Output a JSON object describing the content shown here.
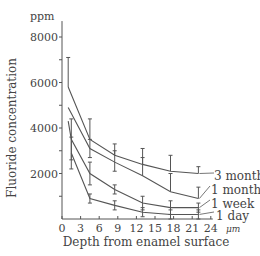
{
  "chart_data": {
    "type": "line",
    "title": "",
    "xlabel": "Depth from enamel surface",
    "x_unit": "μm",
    "ylabel": "Fluoride concentration",
    "y_unit": "ppm",
    "xlim": [
      0,
      24
    ],
    "ylim": [
      0,
      8000
    ],
    "x_ticks": [
      0,
      3,
      6,
      9,
      12,
      15,
      18,
      21,
      24
    ],
    "y_ticks_labeled": [
      2000,
      4000,
      6000,
      8000
    ],
    "y_ticks_minor": [
      1000,
      3000,
      5000,
      7000
    ],
    "grid": false,
    "legend_position": "inline-right",
    "series": [
      {
        "name": "3 months",
        "x": [
          1,
          4.5,
          8.5,
          13,
          17.5,
          22
        ],
        "values": [
          5800,
          3500,
          2800,
          2400,
          2100,
          2000
        ],
        "err_up": [
          1300,
          900,
          500,
          700,
          700,
          300
        ]
      },
      {
        "name": "1 month",
        "x": [
          1,
          4.5,
          8.5,
          13,
          17.5,
          22
        ],
        "values": [
          4900,
          3100,
          2500,
          1900,
          1200,
          900
        ],
        "err_up": [
          0,
          400,
          500,
          800,
          800,
          500
        ],
        "err_down": [
          0,
          400,
          400,
          0,
          0,
          0
        ]
      },
      {
        "name": "1 week",
        "x": [
          1,
          1.5,
          4.5,
          8.5,
          13,
          17.5,
          22
        ],
        "values": [
          4300,
          3500,
          2000,
          1300,
          700,
          500,
          500
        ],
        "err_up": [
          0,
          900,
          500,
          200,
          300,
          300,
          200
        ],
        "err_down": [
          0,
          900,
          500,
          200,
          300,
          300,
          200
        ]
      },
      {
        "name": "1 day",
        "x": [
          1.5,
          4.5,
          8.5,
          13,
          17.5,
          22
        ],
        "values": [
          2900,
          900,
          600,
          300,
          200,
          200
        ],
        "err_up": [
          700,
          200,
          200,
          200,
          200,
          200
        ],
        "err_down": [
          700,
          200,
          200,
          200,
          200,
          200
        ]
      }
    ]
  },
  "labels": {
    "y_unit": "ppm",
    "y_axis": "Fluoride concentration",
    "x_axis": "Depth from enamel surface",
    "x_unit": "μm",
    "series": [
      "3 months",
      "1 month",
      "1 week",
      "1 day"
    ]
  }
}
